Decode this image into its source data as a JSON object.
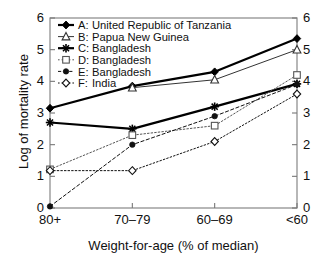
{
  "chart_data": {
    "type": "line",
    "title": "",
    "xlabel": "Weight-for-age (% of median)",
    "ylabel": "Log of mortality rate",
    "categories": [
      "80+",
      "70–79",
      "60–69",
      "<60"
    ],
    "ylim": [
      0,
      6
    ],
    "yticks": [
      "0",
      "1",
      "2",
      "3",
      "4",
      "5",
      "6"
    ],
    "ytick_values": [
      0,
      1,
      2,
      3,
      4,
      5,
      6
    ],
    "grid": false,
    "dual_y_axis": true,
    "right_yticks": [
      "0",
      "1",
      "2",
      "3",
      "4",
      "5",
      "6"
    ],
    "legend_position": "top-left",
    "series": [
      {
        "key": "A",
        "label": "A:",
        "name": "United Republic of Tanzania",
        "marker": "filled-diamond",
        "linestyle": "solid",
        "linewidth": 2.2,
        "color": "#000000",
        "values": [
          3.15,
          3.85,
          4.3,
          5.35
        ]
      },
      {
        "key": "B",
        "label": "B:",
        "name": "Papua New Guinea",
        "marker": "open-triangle",
        "linestyle": "solid",
        "linewidth": 1.0,
        "color": "#333333",
        "values": [
          null,
          3.8,
          4.05,
          5.0
        ]
      },
      {
        "key": "C",
        "label": "C:",
        "name": "Bangladesh",
        "marker": "asterisk",
        "linestyle": "solid",
        "linewidth": 2.2,
        "color": "#000000",
        "values": [
          2.7,
          2.5,
          3.2,
          3.92
        ]
      },
      {
        "key": "D",
        "label": "D:",
        "name": "Bangladesh",
        "marker": "open-square",
        "linestyle": "dotted",
        "linewidth": 1.0,
        "color": "#555555",
        "values": [
          1.22,
          2.3,
          2.6,
          4.2
        ]
      },
      {
        "key": "E",
        "label": "E:",
        "name": "Bangladesh",
        "marker": "filled-circle",
        "linestyle": "dashed",
        "linewidth": 1.0,
        "color": "#111111",
        "values": [
          0.05,
          2.0,
          2.9,
          3.9
        ]
      },
      {
        "key": "F",
        "label": "F:",
        "name": "India",
        "marker": "open-diamond",
        "linestyle": "dotted",
        "linewidth": 1.0,
        "color": "#111111",
        "values": [
          1.18,
          1.18,
          2.1,
          3.6
        ]
      }
    ]
  },
  "axes": {
    "frame_color": "#888888",
    "tick_color": "#777777"
  }
}
